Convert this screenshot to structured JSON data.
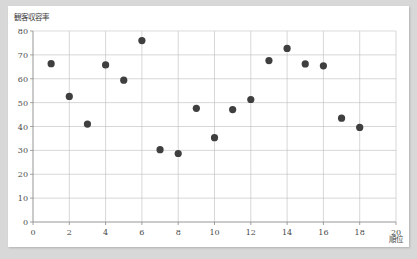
{
  "chart_data": {
    "type": "scatter",
    "title": "",
    "ylabel": "観客収容率",
    "xlabel": "順位",
    "xlim": [
      0,
      20
    ],
    "ylim": [
      0,
      80
    ],
    "x_ticks": [
      0,
      2,
      4,
      6,
      8,
      10,
      12,
      14,
      16,
      18,
      20
    ],
    "y_ticks": [
      0,
      10,
      20,
      30,
      40,
      50,
      60,
      70,
      80
    ],
    "grid": true,
    "legend": "none",
    "marker_color": "#3f3f3f",
    "points": [
      {
        "x": 1,
        "y": 66.3
      },
      {
        "x": 2,
        "y": 52.6
      },
      {
        "x": 3,
        "y": 41.0
      },
      {
        "x": 4,
        "y": 65.8
      },
      {
        "x": 5,
        "y": 59.4
      },
      {
        "x": 6,
        "y": 76.0
      },
      {
        "x": 7,
        "y": 30.3
      },
      {
        "x": 8,
        "y": 28.7
      },
      {
        "x": 9,
        "y": 47.6
      },
      {
        "x": 10,
        "y": 35.3
      },
      {
        "x": 11,
        "y": 47.1
      },
      {
        "x": 12,
        "y": 51.3
      },
      {
        "x": 13,
        "y": 67.6
      },
      {
        "x": 14,
        "y": 72.7
      },
      {
        "x": 15,
        "y": 66.2
      },
      {
        "x": 16,
        "y": 65.4
      },
      {
        "x": 17,
        "y": 43.5
      },
      {
        "x": 18,
        "y": 39.6
      }
    ]
  },
  "colors": {
    "page_background": "#d8d8d8",
    "card_background": "#ffffff",
    "marker": "#3f3f3f",
    "grid": "#bcbcbc",
    "axis": "#8a8a8a",
    "text": "#3a3a3a"
  }
}
